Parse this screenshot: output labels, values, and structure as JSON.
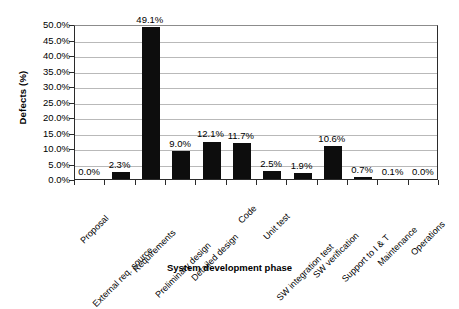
{
  "chart_data": {
    "type": "bar",
    "title": "",
    "xlabel": "System development phase",
    "ylabel": "Defects (%)",
    "categories": [
      "Proposal",
      "External req. source",
      "Requirements",
      "Preliminary design",
      "Detailed design",
      "Code",
      "Unit test",
      "SW integration test",
      "SW verification",
      "Support to I & T",
      "Maintenance",
      "Operations"
    ],
    "values": [
      0.0,
      2.3,
      49.1,
      9.0,
      12.1,
      11.7,
      2.5,
      1.9,
      10.6,
      0.7,
      0.1,
      0.0
    ],
    "data_labels": [
      "0.0%",
      "2.3%",
      "49.1%",
      "9.0%",
      "12.1%",
      "11.7%",
      "2.5%",
      "1.9%",
      "10.6%",
      "0.7%",
      "0.1%",
      "0.0%"
    ],
    "ylim": [
      0,
      50
    ],
    "ytick_values": [
      0,
      5,
      10,
      15,
      20,
      25,
      30,
      35,
      40,
      45,
      50
    ],
    "ytick_labels": [
      "0.0%",
      "5.0%",
      "10.0%",
      "15.0%",
      "20.0%",
      "25.0%",
      "30.0%",
      "35.0%",
      "40.0%",
      "45.0%",
      "50.0%"
    ],
    "grid": true,
    "legend": "none",
    "bar_color": "#0d0d0d",
    "gridline_color": "#b9b9b9",
    "axis_color": "#2b2b2b",
    "background_color": "#ffffff"
  }
}
